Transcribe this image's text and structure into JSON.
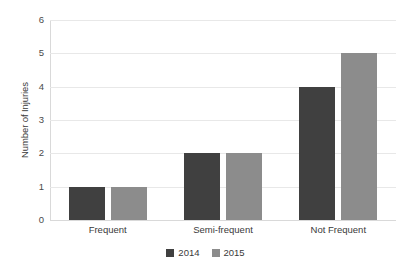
{
  "chart_data": {
    "type": "bar",
    "title": "",
    "subtitle": "",
    "xlabel": "",
    "ylabel": "Number of Injuries",
    "categories": [
      "Frequent",
      "Semi-frequent",
      "Not Frequent"
    ],
    "series": [
      {
        "name": "2014",
        "values": [
          1,
          2,
          4
        ],
        "color": "#404040"
      },
      {
        "name": "2015",
        "values": [
          1,
          2,
          5
        ],
        "color": "#8c8c8c"
      }
    ],
    "ylim": [
      0,
      6
    ],
    "ytick_labels": [
      "0",
      "1",
      "2",
      "3",
      "4",
      "5",
      "6"
    ],
    "ytick_values": [
      0,
      1,
      2,
      3,
      4,
      5,
      6
    ],
    "grid": true,
    "grid_color": "#e8e8e8",
    "legend_position": "bottom-center",
    "background_color": "#ffffff",
    "orientation": "vertical",
    "grouped": true
  },
  "axes": {
    "y_title": "Number of Injuries"
  },
  "legend": {
    "items": [
      {
        "label": "2014",
        "color": "#404040"
      },
      {
        "label": "2015",
        "color": "#8c8c8c"
      }
    ]
  }
}
